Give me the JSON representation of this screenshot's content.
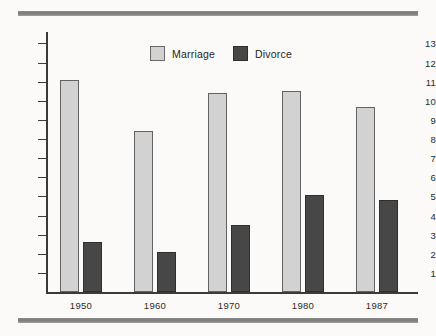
{
  "chart_data": {
    "type": "bar",
    "title": "",
    "subtitle": "",
    "xlabel": "",
    "ylabel": "",
    "categories": [
      "1950",
      "1960",
      "1970",
      "1980",
      "1987"
    ],
    "series": [
      {
        "name": "Marriage",
        "color": "#d2d2d2",
        "values": [
          11.1,
          8.4,
          10.4,
          10.5,
          9.7
        ]
      },
      {
        "name": "Divorce",
        "color": "#474747",
        "values": [
          2.6,
          2.1,
          3.5,
          5.1,
          4.8
        ]
      }
    ],
    "ylim": [
      0,
      13.6
    ],
    "yticks": [
      1,
      2,
      3,
      4,
      5,
      6,
      7,
      8,
      9,
      10,
      11,
      12,
      13
    ],
    "ytick_labels": [
      "1",
      "2",
      "3",
      "4",
      "5",
      "6",
      "7",
      "8",
      "9",
      "10",
      "11",
      "12",
      "13"
    ],
    "grid": false,
    "legend_position": "top-center",
    "annotations": []
  },
  "legend": {
    "items": [
      {
        "label": "Marriage",
        "swatch": "marriage-swatch"
      },
      {
        "label": "Divorce",
        "swatch": "divorce-swatch"
      }
    ]
  },
  "decorations": {
    "rule_color": "#7f7f7f",
    "background_color": "#fbfaf8",
    "axis_color": "#3a3a3a"
  }
}
